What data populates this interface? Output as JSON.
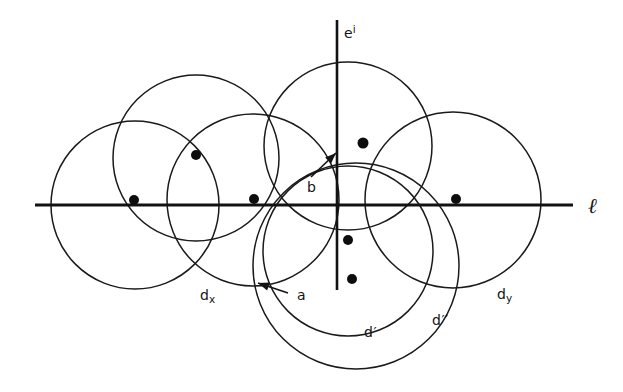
{
  "figure": {
    "background_color": "#ffffff",
    "stroke_color": "#1a1a1a",
    "dot_color": "#0d0d0d",
    "width": 623,
    "height": 392
  },
  "labels": {
    "axis_vertical_base": "e",
    "axis_vertical_sup": "i",
    "axis_horizontal": "ℓ",
    "disk_x_base": "d",
    "disk_x_sub": "x",
    "disk_y_base": "d",
    "disk_y_sub": "y",
    "disk_prime": "d′",
    "disk_double_prime": "d′′",
    "point_a": "a",
    "point_b": "b"
  },
  "chart_data": {
    "type": "diagram",
    "xlabel": "ℓ",
    "ylabel": "e^i",
    "grid": false,
    "legend": "none",
    "xlim": [
      0,
      623
    ],
    "ylim": [
      0,
      392
    ],
    "axes": [
      {
        "name": "horizontal-line",
        "label": "ℓ",
        "orientation": "horizontal",
        "y": 205,
        "x_start": 35,
        "x_end": 573,
        "label_x": 588,
        "label_y": 196
      },
      {
        "name": "vertical-axis",
        "label": "e^i",
        "orientation": "vertical",
        "x": 337,
        "y_start": 20,
        "y_end": 290,
        "label_x": 344,
        "label_y": 24
      }
    ],
    "circles": [
      {
        "name": "circle-left-outer",
        "cx": 135,
        "cy": 205,
        "r": 84
      },
      {
        "name": "circle-upper-left",
        "cx": 196,
        "cy": 158,
        "r": 83
      },
      {
        "name": "circle-mid-left-dx",
        "cx": 253,
        "cy": 200,
        "r": 86
      },
      {
        "name": "circle-upper-middle",
        "cx": 348,
        "cy": 146,
        "r": 84
      },
      {
        "name": "circle-right-dy",
        "cx": 453,
        "cy": 200,
        "r": 88
      },
      {
        "name": "circle-lower-dprime",
        "cx": 348,
        "cy": 251,
        "r": 85
      },
      {
        "name": "circle-lower-ddprime",
        "cx": 356,
        "cy": 266,
        "r": 103
      }
    ],
    "points": [
      {
        "name": "dot-1",
        "x": 134,
        "y": 200,
        "r": 5
      },
      {
        "name": "dot-2",
        "x": 196,
        "y": 155,
        "r": 5
      },
      {
        "name": "dot-3",
        "x": 254,
        "y": 199,
        "r": 5
      },
      {
        "name": "dot-4",
        "x": 363,
        "y": 143,
        "r": 5.5
      },
      {
        "name": "dot-5",
        "x": 456,
        "y": 199,
        "r": 5
      },
      {
        "name": "dot-6",
        "x": 348,
        "y": 240,
        "r": 5
      },
      {
        "name": "dot-7",
        "x": 352,
        "y": 279,
        "r": 5
      }
    ],
    "annotations": [
      {
        "name": "annotation-a",
        "text": "a",
        "label_x": 297,
        "label_y": 288,
        "leader_from": [
          288,
          293
        ],
        "leader_to": [
          258,
          283
        ],
        "arrow_at": [
          258,
          283
        ]
      },
      {
        "name": "annotation-b",
        "text": "b",
        "label_x": 307,
        "label_y": 180,
        "leader_from": [
          311,
          177
        ],
        "leader_to": [
          336,
          153
        ],
        "arrow_at": [
          336,
          153
        ]
      },
      {
        "name": "annotation-dx",
        "text": "d_x",
        "label_x": 200,
        "label_y": 288
      },
      {
        "name": "annotation-dy",
        "text": "d_y",
        "label_x": 497,
        "label_y": 287
      },
      {
        "name": "annotation-dprime",
        "text": "d′",
        "label_x": 364,
        "label_y": 325
      },
      {
        "name": "annotation-ddprime",
        "text": "d′′",
        "label_x": 432,
        "label_y": 313
      }
    ]
  }
}
